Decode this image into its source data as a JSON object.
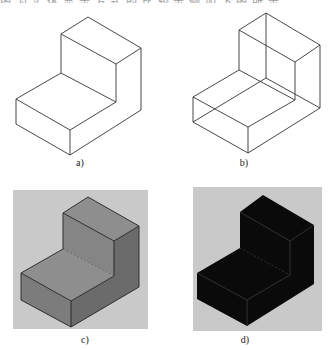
{
  "header": {
    "clipped_text": "图 为 实 体 显 示 方 式 的 比 较 示 例 如 下 图 所 示"
  },
  "figure": {
    "panels": [
      {
        "id": "a",
        "label": "a)",
        "style": "wireframe-hidden-removed"
      },
      {
        "id": "b",
        "label": "b)",
        "style": "wireframe-all-edges"
      },
      {
        "id": "c",
        "label": "c)",
        "style": "shaded-gray"
      },
      {
        "id": "d",
        "label": "d)",
        "style": "shaded-black"
      }
    ],
    "colors": {
      "line": "#333333",
      "panel_bg": "#c9c9c9",
      "gray_top": "#8e8e8e",
      "gray_left": "#7c7c7c",
      "gray_right": "#6b6b6b",
      "black_face": "#0a0a0a",
      "black_edge": "#3a3a3a"
    }
  }
}
